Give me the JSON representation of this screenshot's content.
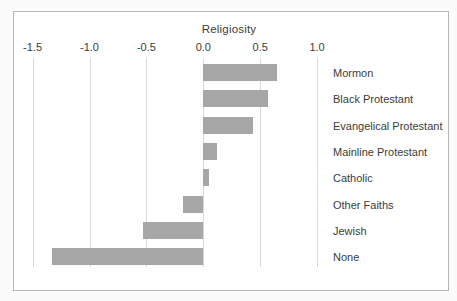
{
  "chart_data": {
    "type": "bar",
    "orientation": "horizontal",
    "title": "Religiosity",
    "categories": [
      "Mormon",
      "Black Protestant",
      "Evangelical Protestant",
      "Mainline Protestant",
      "Catholic",
      "Other Faiths",
      "Jewish",
      "None"
    ],
    "values": [
      0.65,
      0.57,
      0.44,
      0.12,
      0.05,
      -0.18,
      -0.53,
      -1.33
    ],
    "x_tick_labels": [
      "-1.5",
      "-1.0",
      "-0.5",
      "0.0",
      "0.5",
      "1.0"
    ],
    "x_tick_values": [
      -1.5,
      -1.0,
      -0.5,
      0.0,
      0.5,
      1.0
    ],
    "xlim": [
      -1.66,
      1.15
    ],
    "grid": true,
    "legend": "none",
    "xlabel": "",
    "ylabel": "",
    "colors": {
      "bar": "#a7a7a7",
      "gridline": "#d8d8d8",
      "panel_border": "#b8b8b8",
      "text": "#3c3c3c",
      "panel_background": "#ffffff",
      "page_background": "#fbfbfb"
    }
  }
}
